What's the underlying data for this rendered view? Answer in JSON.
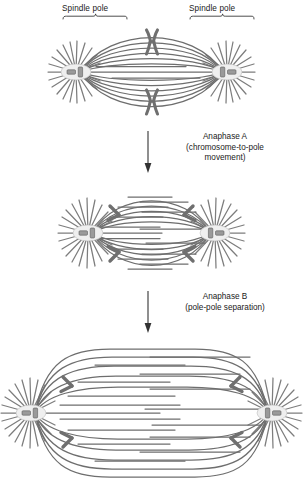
{
  "figure": {
    "type": "biological-diagram",
    "colors": {
      "microtubule": "#6e6e6e",
      "astral": "#7a7a7a",
      "chromosome": "#737373",
      "chromosome_outline": "#4a4a4a",
      "centrosome_fill": "#e8e8e8",
      "centriole": "#8c8c8c",
      "text": "#1a1a1a",
      "arrow": "#333333",
      "background": "#ffffff"
    }
  },
  "labels": {
    "spindle_pole_left": "Spindle pole",
    "spindle_pole_right": "Spindle pole"
  },
  "annotations": [
    {
      "id": "anaphase-a",
      "title": "Anaphase A",
      "subtitle_line1": "(chromosome-to-pole",
      "subtitle_line2": "movement)"
    },
    {
      "id": "anaphase-b",
      "title": "Anaphase B",
      "subtitle_line1": "(pole-pole separation)",
      "subtitle_line2": ""
    }
  ],
  "panels": [
    {
      "id": "metaphase",
      "stage": "Metaphase / early anaphase",
      "pole_count": 2,
      "chromosome_count": 2,
      "chromosome_shape": "paired-sister-chromatids",
      "spindle_width": 125,
      "description": "Two spindle poles with astral microtubules; duplicated chromosomes aligned at the spindle equator"
    },
    {
      "id": "anaphase-a",
      "stage": "Anaphase A",
      "pole_count": 2,
      "chromosome_count": 4,
      "chromosome_shape": "v-shaped-chromatid",
      "spindle_width": 125,
      "description": "Sister chromatids separated and moving toward the poles; kinetochore microtubules shorten"
    },
    {
      "id": "anaphase-b",
      "stage": "Anaphase B",
      "pole_count": 2,
      "chromosome_count": 4,
      "chromosome_shape": "v-shaped-chromatid",
      "spindle_width": 250,
      "description": "Spindle poles move further apart as interpolar microtubules elongate and slide"
    }
  ]
}
